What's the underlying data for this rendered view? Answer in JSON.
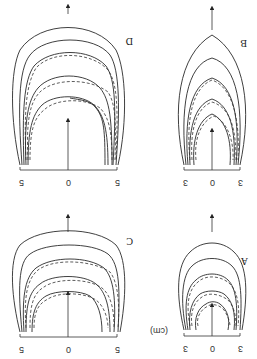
{
  "figure": {
    "orientation": "rotated 180 degrees",
    "unit_label": "(cm)",
    "panels": [
      {
        "id": "D",
        "label": "D",
        "ticks": [
          "5",
          "0",
          "5"
        ]
      },
      {
        "id": "B",
        "label": "B",
        "ticks": [
          "3",
          "0",
          "3"
        ]
      },
      {
        "id": "C",
        "label": "C",
        "ticks": [
          "5",
          "0",
          "5"
        ]
      },
      {
        "id": "A",
        "label": "A",
        "ticks": [
          "3",
          "0",
          "3"
        ]
      }
    ]
  }
}
